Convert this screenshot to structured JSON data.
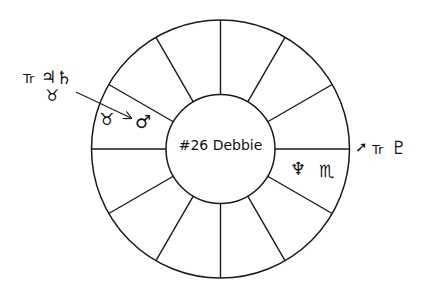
{
  "chart": {
    "center_label": "#26 Debbie",
    "stroke_color": "#1a1a1a",
    "background": "#ffffff",
    "house_count": 12
  },
  "annotations": {
    "left": {
      "transit_prefix": "Tr",
      "planet_1": "♃",
      "planet_1_name": "Jupiter",
      "planet_2": "♄",
      "planet_2_name": "Saturn",
      "sign": "♉",
      "sign_name": "Taurus"
    },
    "right": {
      "sign": "➚",
      "sign_name": "Sagittarius",
      "transit_prefix": "Tr",
      "planet": "♇",
      "planet_name": "Pluto"
    }
  },
  "houses": {
    "upper_left": {
      "sign": "♉",
      "sign_name": "Taurus",
      "planet": "♂",
      "planet_name": "Mars"
    },
    "lower_right": {
      "planet": "♆",
      "planet_name": "Neptune",
      "sign": "♏",
      "sign_name": "Scorpio"
    }
  }
}
